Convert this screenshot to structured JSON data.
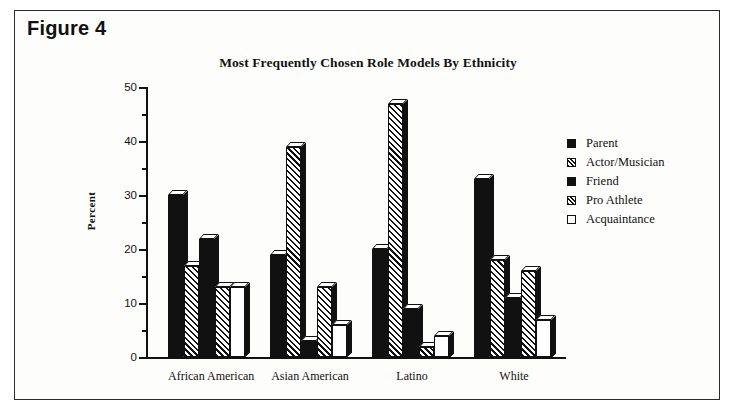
{
  "figure": {
    "caption": "Figure 4"
  },
  "chart_data": {
    "type": "bar",
    "title": "Most Frequently Chosen Role Models By Ethnicity",
    "xlabel": "",
    "ylabel": "Percent",
    "ylim": [
      0,
      50
    ],
    "yticks": [
      0,
      10,
      20,
      30,
      40,
      50
    ],
    "ytick_labels": [
      "0",
      "10",
      "20",
      "30",
      "40",
      "50"
    ],
    "yminor_ticks": [
      5,
      15,
      25,
      35,
      45
    ],
    "grid": false,
    "legend_position": "right",
    "categories": [
      "African American",
      "Asian American",
      "Latino",
      "White"
    ],
    "series": [
      {
        "name": "Parent",
        "pattern": "solid",
        "values": [
          30,
          19,
          20,
          33
        ]
      },
      {
        "name": "Actor/Musician",
        "pattern": "hatch",
        "values": [
          17,
          39,
          47,
          18
        ]
      },
      {
        "name": "Friend",
        "pattern": "solid",
        "values": [
          22,
          3,
          9,
          11
        ]
      },
      {
        "name": "Pro Athlete",
        "pattern": "hatch",
        "values": [
          13,
          13,
          2,
          16
        ]
      },
      {
        "name": "Acquaintance",
        "pattern": "open",
        "values": [
          13,
          6,
          4,
          7
        ]
      }
    ]
  },
  "colors": {
    "ink": "#111111",
    "paper": "#fdfdfc",
    "frame": "#2b2b2b"
  }
}
